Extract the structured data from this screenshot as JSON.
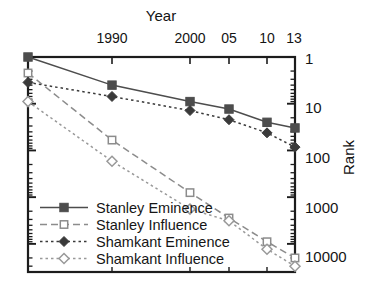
{
  "chart_data": {
    "type": "line",
    "title": "",
    "xlabel": "Year",
    "ylabel": "Rank",
    "x": [
      1985,
      1990,
      2000,
      2005,
      2010,
      2013
    ],
    "xtick_labels": [
      "",
      "1990",
      "2000",
      "05",
      "10",
      "13"
    ],
    "xlim": [
      1985,
      2013
    ],
    "ylim": [
      1,
      40000
    ],
    "yscale": "log",
    "y_inverted": true,
    "ytick_labels": [
      "1",
      "10",
      "100",
      "1000",
      "10000"
    ],
    "ytick_values": [
      1,
      10,
      100,
      1000,
      10000
    ],
    "grid": false,
    "legend_position": "lower-left",
    "series": [
      {
        "name": "Stanley Eminence",
        "marker": "filled-square",
        "linestyle": "solid",
        "color": "#4d4d4d",
        "values": [
          1,
          4,
          9,
          13,
          25,
          33
        ]
      },
      {
        "name": "Stanley Influence",
        "marker": "open-square",
        "linestyle": "dashed",
        "color": "#8c8c8c",
        "values": [
          2.2,
          60,
          800,
          2800,
          9000,
          20000
        ]
      },
      {
        "name": "Shamkant Eminence",
        "marker": "filled-diamond",
        "linestyle": "dotted",
        "color": "#3a3a3a",
        "values": [
          3.5,
          7,
          14,
          22,
          42,
          85
        ]
      },
      {
        "name": "Shamkant Influence",
        "marker": "open-diamond",
        "linestyle": "dotted",
        "color": "#999999",
        "values": [
          9,
          170,
          1800,
          3200,
          13000,
          30000
        ]
      }
    ]
  },
  "axes": {
    "x_title": "Year",
    "y_title": "Rank",
    "xticks": [
      {
        "label": "",
        "px": 28
      },
      {
        "label": "1990",
        "px": 112
      },
      {
        "label": "2000",
        "px": 190
      },
      {
        "label": "05",
        "px": 229
      },
      {
        "label": "10",
        "px": 267
      },
      {
        "label": "13",
        "px": 295
      }
    ],
    "yticks": [
      {
        "label": "1",
        "px": 58
      },
      {
        "label": "10",
        "px": 107
      },
      {
        "label": "100",
        "px": 157
      },
      {
        "label": "1000",
        "px": 207
      },
      {
        "label": "10000",
        "px": 256
      }
    ]
  },
  "legend": {
    "items": [
      {
        "label": "Stanley Eminence"
      },
      {
        "label": "Stanley Influence"
      },
      {
        "label": "Shamkant Eminence"
      },
      {
        "label": "Shamkant Influence"
      }
    ]
  }
}
